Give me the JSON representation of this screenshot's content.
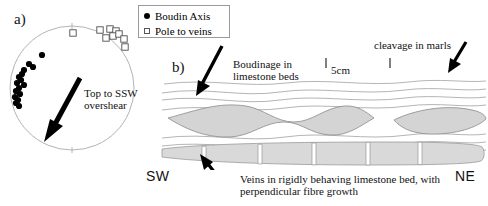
{
  "figure": {
    "panel_a_letter": "a)",
    "panel_b_letter": "b)"
  },
  "legend": {
    "items": [
      {
        "symbol": "filled-circle",
        "label": "Boudin Axis"
      },
      {
        "symbol": "open-square",
        "label": "Pole to veins"
      }
    ]
  },
  "stereonet": {
    "shear_label_line1": "Top to SSW",
    "shear_label_line2": "overshear",
    "circle": {
      "cx": 72,
      "cy": 88,
      "r": 62,
      "stroke": "#b0b0b0"
    },
    "boudin_axis_points": [
      [
        42,
        55
      ],
      [
        29,
        64
      ],
      [
        33,
        67
      ],
      [
        24,
        70
      ],
      [
        22,
        74
      ],
      [
        19,
        77
      ],
      [
        21,
        80
      ],
      [
        17,
        83
      ],
      [
        24,
        85
      ],
      [
        19,
        88
      ],
      [
        16,
        91
      ],
      [
        20,
        94
      ],
      [
        15,
        97
      ],
      [
        18,
        100
      ],
      [
        16,
        103
      ],
      [
        19,
        106
      ]
    ],
    "pole_to_veins_points": [
      [
        73,
        33
      ],
      [
        100,
        30
      ],
      [
        110,
        29
      ],
      [
        116,
        31
      ],
      [
        113,
        36
      ],
      [
        106,
        38
      ],
      [
        119,
        34
      ],
      [
        124,
        39
      ],
      [
        125,
        47
      ]
    ]
  },
  "cross_section": {
    "boudinage_label_line1": "Boudinage in",
    "boudinage_label_line2": "limestone beds",
    "cleavage_label": "cleavage in marls",
    "veins_label_line1": "Veins in rigidly behaving limestone bed, with",
    "veins_label_line2": "perpendicular fibre growth",
    "scale_bar_label": "5cm",
    "direction_left": "SW",
    "direction_right": "NE"
  },
  "colors": {
    "lens_fill": "#d4d4d4",
    "lens_stroke": "#8a8a8a",
    "bed_fill": "#d9d9d9",
    "bedding_line": "#a8a8a8",
    "arrow": "#000000",
    "vein_fill": "#ffffff"
  }
}
